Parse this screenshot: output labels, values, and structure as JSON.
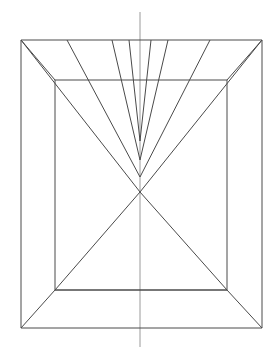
{
  "figure": {
    "title": "One-point perspective line drawing of a rectangular room interior",
    "type": "line-drawing",
    "canvas": {
      "width": 275,
      "height": 353,
      "background": "#ffffff"
    },
    "colors": {
      "construction_line": "#4a4a4a",
      "axis_line": "#9a9a9a",
      "background": "#ffffff"
    },
    "stroke_width": 1,
    "geometry": {
      "outer_rectangle": {
        "name": "outer-frame",
        "left": 21,
        "top": 40,
        "right": 262,
        "bottom": 328,
        "points": "21,40 262,40 262,328 21,328"
      },
      "inner_rectangle": {
        "name": "inner-frame",
        "left": 55,
        "top": 80,
        "right": 227,
        "bottom": 290,
        "points": "55,80 227,80 227,290 55,290"
      },
      "center_axis": {
        "name": "vertical-center-axis",
        "x": 140,
        "y_start": 12,
        "y_end": 347
      },
      "corner_diagonals": [
        {
          "name": "corner-diagonal-top-left",
          "x1": 21,
          "y1": 40,
          "x2": 55,
          "y2": 80
        },
        {
          "name": "corner-diagonal-top-right",
          "x1": 262,
          "y1": 40,
          "x2": 227,
          "y2": 80
        },
        {
          "name": "corner-diagonal-bottom-right",
          "x1": 262,
          "y1": 328,
          "x2": 227,
          "y2": 290
        },
        {
          "name": "corner-diagonal-bottom-left",
          "x1": 21,
          "y1": 328,
          "x2": 55,
          "y2": 290
        }
      ],
      "fan_vertices": [
        {
          "name": "fan-apex-outer",
          "x": 140,
          "y": 192
        },
        {
          "name": "fan-apex-third",
          "x": 140,
          "y": 177
        },
        {
          "name": "fan-apex-second",
          "x": 140,
          "y": 160
        },
        {
          "name": "fan-apex-inner",
          "x": 140,
          "y": 141
        }
      ],
      "fan_lines": [
        {
          "name": "fan-line-left-outer",
          "x1": 21,
          "y1": 40,
          "x2": 140,
          "y2": 192
        },
        {
          "name": "fan-line-left-third",
          "x1": 67,
          "y1": 40,
          "x2": 140,
          "y2": 177
        },
        {
          "name": "fan-line-left-second",
          "x1": 112,
          "y1": 40,
          "x2": 140,
          "y2": 160
        },
        {
          "name": "fan-line-left-inner",
          "x1": 129,
          "y1": 40,
          "x2": 140,
          "y2": 141
        },
        {
          "name": "fan-line-right-inner",
          "x1": 151,
          "y1": 40,
          "x2": 140,
          "y2": 141
        },
        {
          "name": "fan-line-right-second",
          "x1": 168,
          "y1": 40,
          "x2": 140,
          "y2": 160
        },
        {
          "name": "fan-line-right-third",
          "x1": 210,
          "y1": 40,
          "x2": 140,
          "y2": 177
        },
        {
          "name": "fan-line-right-outer",
          "x1": 262,
          "y1": 40,
          "x2": 140,
          "y2": 192
        }
      ],
      "floor_triangle": {
        "name": "floor-triangle",
        "apex": {
          "x": 140,
          "y": 192
        },
        "base_left": {
          "x": 55,
          "y": 290
        },
        "base_right": {
          "x": 227,
          "y": 290
        },
        "points": "140,192 55,290 227,290"
      }
    },
    "counts": {
      "fan_lines": 8,
      "corner_diagonals": 4,
      "rectangles": 2,
      "convergence_points": 4
    }
  }
}
